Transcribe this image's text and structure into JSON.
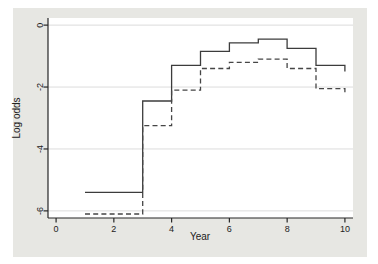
{
  "figure": {
    "outer_background": "#ffffff",
    "panel_background": "#e7e7e3",
    "plot_background": "#ffffff",
    "grid_color": "#dcdcdc",
    "axis_color": "#262626",
    "tick_label_color": "#222222",
    "solid_line_color": "#3c3c3c",
    "dashed_line_color": "#464646"
  },
  "chart_data": {
    "type": "line",
    "subtype": "step-post",
    "title": "",
    "xlabel": "Year",
    "ylabel": "Log odds",
    "xlim": [
      -0.28,
      10.28
    ],
    "ylim": [
      -6.23,
      0.23
    ],
    "x_ticks": [
      0,
      2,
      4,
      6,
      8,
      10
    ],
    "y_ticks": [
      0,
      -2,
      -4,
      -6
    ],
    "x_tick_labels": [
      "0",
      "2",
      "4",
      "6",
      "8",
      "10"
    ],
    "y_tick_labels": [
      "0",
      "-2",
      "-4",
      "-6"
    ],
    "grid": true,
    "legend_position": "none",
    "series": [
      {
        "name": "solid",
        "style": "solid",
        "steps": [
          [
            1,
            -5.4
          ],
          [
            3,
            -2.45
          ],
          [
            4,
            -1.3
          ],
          [
            5,
            -0.85
          ],
          [
            6,
            -0.57
          ],
          [
            7,
            -0.45
          ],
          [
            8,
            -0.75
          ],
          [
            9,
            -1.3
          ],
          [
            10,
            -1.5
          ]
        ]
      },
      {
        "name": "dashed",
        "style": "dashed",
        "steps": [
          [
            1,
            -6.1
          ],
          [
            3,
            -3.25
          ],
          [
            4,
            -2.1
          ],
          [
            5,
            -1.4
          ],
          [
            6,
            -1.2
          ],
          [
            7,
            -1.1
          ],
          [
            8,
            -1.4
          ],
          [
            9,
            -2.05
          ],
          [
            10,
            -2.2
          ]
        ]
      }
    ]
  }
}
